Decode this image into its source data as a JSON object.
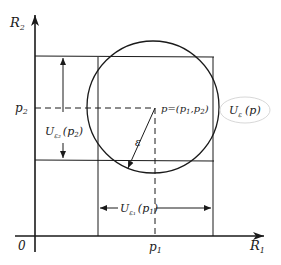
{
  "diagram": {
    "axes": {
      "y_label": "R",
      "y_label_sub": "2",
      "x_label": "R",
      "x_label_sub": "1",
      "origin": "0"
    },
    "ticks": {
      "x_tick": "p",
      "x_tick_sub": "1",
      "y_tick": "p",
      "y_tick_sub": "2"
    },
    "point_label": "p=(p",
    "point_label_sub1": "1",
    "point_label_mid": ",p",
    "point_label_sub2": "2",
    "point_label_end": ")",
    "radius_label": "ε",
    "circle_label": "U",
    "circle_label_sub": "ε",
    "circle_label_arg": "(p)",
    "interval_y": {
      "main": "U",
      "sub": "ε₂",
      "arg": "(p",
      "arg_sub": "2",
      "arg_end": ")"
    },
    "interval_x": {
      "main": "U",
      "sub": "ε₁",
      "arg": "(p",
      "arg_sub": "1",
      "arg_end": ")"
    },
    "colors": {
      "ink": "#1a1a1a",
      "background": "#ffffff",
      "highlight_ring": "#d8d8d8"
    }
  }
}
